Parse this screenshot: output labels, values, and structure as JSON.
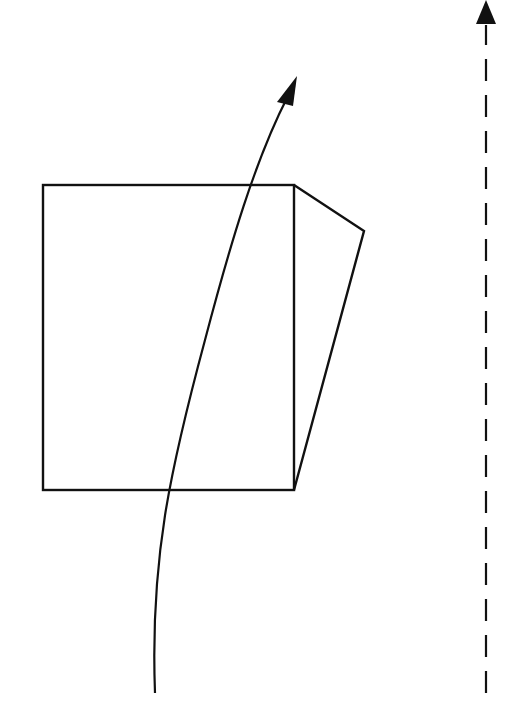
{
  "diagram": {
    "stroke_color": "#111111",
    "background": "#ffffff",
    "square": {
      "x": 43,
      "y": 185,
      "width": 251,
      "height": 305
    },
    "side_face": {
      "points": "294,185 364,231 294,490"
    },
    "curved_arrow": {
      "path": "M155,693 C150,560 170,470 205,340 C230,245 255,160 288,96",
      "head": "297,76 277,102 293,106"
    },
    "dashed_arrow": {
      "x": 486,
      "y1": 693,
      "y2": 25,
      "dash": "22,14",
      "head": "486,0 476,24 496,24"
    }
  }
}
